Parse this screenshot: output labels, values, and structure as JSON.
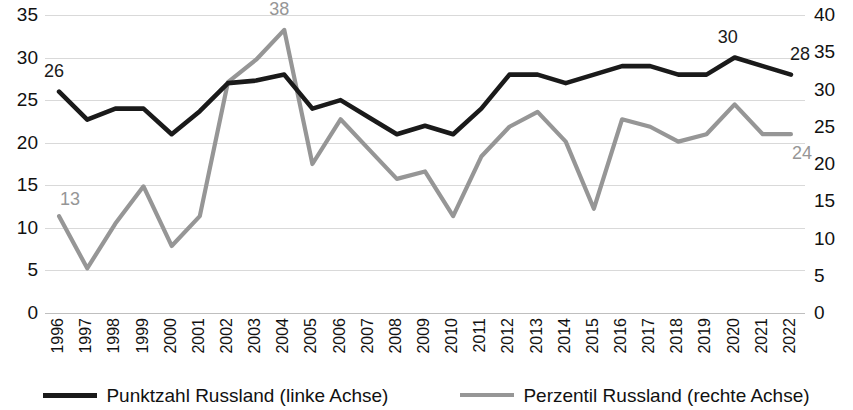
{
  "chart_data": {
    "type": "line",
    "title": "",
    "subtitle": "",
    "xlabel": "",
    "ylabel": "",
    "y2label": "",
    "grid": true,
    "legend_position": "bottom",
    "x": [
      "1996",
      "1997",
      "1998",
      "1999",
      "2000",
      "2001",
      "2002",
      "2003",
      "2004",
      "2005",
      "2006",
      "2007",
      "2008",
      "2009",
      "2010",
      "2011",
      "2012",
      "2013",
      "2014",
      "2015",
      "2016",
      "2017",
      "2018",
      "2019",
      "2020",
      "2021",
      "2022"
    ],
    "categories": [
      "1996",
      "1997",
      "1998",
      "1999",
      "2000",
      "2001",
      "2002",
      "2003",
      "2004",
      "2005",
      "2006",
      "2007",
      "2008",
      "2009",
      "2010",
      "2011",
      "2012",
      "2013",
      "2014",
      "2015",
      "2016",
      "2017",
      "2018",
      "2019",
      "2020",
      "2021",
      "2022"
    ],
    "yticks_left": [
      "0",
      "5",
      "10",
      "15",
      "20",
      "25",
      "30",
      "35"
    ],
    "yticks_right": [
      "0",
      "5",
      "10",
      "15",
      "20",
      "25",
      "30",
      "35",
      "40"
    ],
    "ylim": [
      0,
      35
    ],
    "y2lim": [
      0,
      40
    ],
    "series": [
      {
        "name": "Punktzahl Russland (linke Achse)",
        "axis": "left",
        "color": "#1a1a1a",
        "values": [
          26,
          22.7,
          24,
          24,
          21,
          23.7,
          27,
          27.3,
          28,
          24,
          25,
          23,
          21,
          22,
          21,
          24,
          28,
          28,
          27,
          28,
          29,
          29,
          28,
          28,
          30,
          29,
          28
        ]
      },
      {
        "name": "Perzentil Russland (rechte Achse)",
        "axis": "right",
        "color": "#969696",
        "values": [
          13,
          6,
          12,
          17,
          9,
          13,
          31,
          34,
          38,
          20,
          26,
          22,
          18,
          19,
          13,
          21,
          25,
          27,
          23,
          14,
          26,
          25,
          23,
          24,
          28,
          24,
          24
        ]
      }
    ],
    "annotations": [
      {
        "text": "26",
        "series": "Punktzahl Russland (linke Achse)",
        "x": "1996",
        "value": 26
      },
      {
        "text": "38",
        "series": "Perzentil Russland (rechte Achse)",
        "x": "2004",
        "value": 38
      },
      {
        "text": "30",
        "series": "Punktzahl Russland (linke Achse)",
        "x": "2020",
        "value": 30
      },
      {
        "text": "28",
        "series": "Punktzahl Russland (linke Achse)",
        "x": "2022",
        "value": 28
      },
      {
        "text": "13",
        "series": "Perzentil Russland (rechte Achse)",
        "x": "1996",
        "value": 13
      },
      {
        "text": "24",
        "series": "Perzentil Russland (rechte Achse)",
        "x": "2022",
        "value": 24
      }
    ]
  },
  "legend": {
    "items": [
      {
        "label": "Punktzahl Russland (linke Achse)",
        "color": "#1a1a1a"
      },
      {
        "label": "Perzentil Russland (rechte Achse)",
        "color": "#969696"
      }
    ]
  },
  "colors": {
    "series_black": "#1a1a1a",
    "series_gray": "#969696",
    "gridline": "#d9d9d9",
    "background": "#ffffff",
    "text": "#111111"
  }
}
